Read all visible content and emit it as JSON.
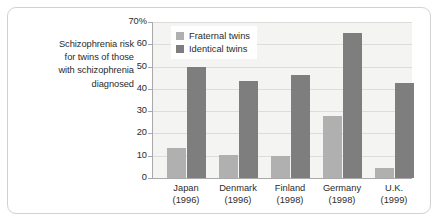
{
  "caption": {
    "lines": [
      "Schizophrenia risk",
      "for twins of those",
      "with schizophrenia",
      "diagnosed"
    ]
  },
  "legend": {
    "items": [
      {
        "label": "Fraternal twins",
        "color": "#b0b0b0",
        "swatch": "legend-swatch-fraternal"
      },
      {
        "label": "Identical twins",
        "color": "#7e7e7e",
        "swatch": "legend-swatch-identical"
      }
    ]
  },
  "axis": {
    "y_ticks": [
      "70%",
      "60",
      "50",
      "40",
      "30",
      "20",
      "10",
      "0"
    ],
    "x_labels": [
      {
        "name": "Japan",
        "year": "(1996)"
      },
      {
        "name": "Denmark",
        "year": "(1996)"
      },
      {
        "name": "Finland",
        "year": "(1998)"
      },
      {
        "name": "Germany",
        "year": "(1998)"
      },
      {
        "name": "U.K.",
        "year": "(1999)"
      }
    ]
  },
  "colors": {
    "fraternal": "#b0b0b0",
    "identical": "#7e7e7e",
    "plot_background": "#f4f4f2",
    "gridline": "#dcdcda",
    "axis": "#a9a9a9",
    "frame_border": "#d2d2d2",
    "text": "#2b2b2b"
  },
  "chart_data": {
    "type": "bar",
    "title": "Schizophrenia risk for twins of those with schizophrenia diagnosed",
    "xlabel": "",
    "ylabel": "",
    "ylim": [
      0,
      70
    ],
    "yticks": [
      0,
      10,
      20,
      30,
      40,
      50,
      60,
      70
    ],
    "ytick_labels": [
      "0",
      "10",
      "20",
      "30",
      "40",
      "50",
      "60",
      "70%"
    ],
    "grid": true,
    "legend_position": "top-left-inside",
    "categories": [
      "Japan (1996)",
      "Denmark (1996)",
      "Finland (1998)",
      "Germany (1998)",
      "U.K. (1999)"
    ],
    "category_names": [
      "Japan",
      "Denmark",
      "Finland",
      "Germany",
      "U.K."
    ],
    "category_years": [
      "(1996)",
      "(1996)",
      "(1998)",
      "(1998)",
      "(1999)"
    ],
    "series": [
      {
        "name": "Fraternal twins",
        "color": "#b0b0b0",
        "values": [
          13.5,
          10.5,
          10,
          28,
          4.5
        ]
      },
      {
        "name": "Identical twins",
        "color": "#7e7e7e",
        "values": [
          50,
          43.5,
          46,
          65,
          42.5
        ]
      }
    ],
    "units": "percent"
  },
  "layout": {
    "plot": {
      "left": 153,
      "top": 22,
      "width": 259,
      "height": 156
    },
    "group_centers": [
      186,
      238,
      290,
      342,
      394
    ],
    "bar_width": 19,
    "bar_gap": 1
  }
}
